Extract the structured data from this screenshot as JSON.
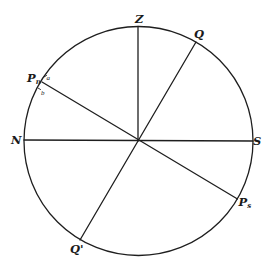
{
  "diagram": {
    "type": "celestial-sphere-meridian",
    "labels": {
      "zenith": "Z",
      "q_upper": "Q",
      "q_lower": "Q'",
      "north": "N",
      "south": "S",
      "pole_north": "P",
      "pole_north_sub": "n",
      "pole_south": "P",
      "pole_south_sub": "s",
      "mark_a": "a",
      "mark_b": "b"
    },
    "colors": {
      "line": "#1e1e1e",
      "background": "#ffffff"
    }
  }
}
